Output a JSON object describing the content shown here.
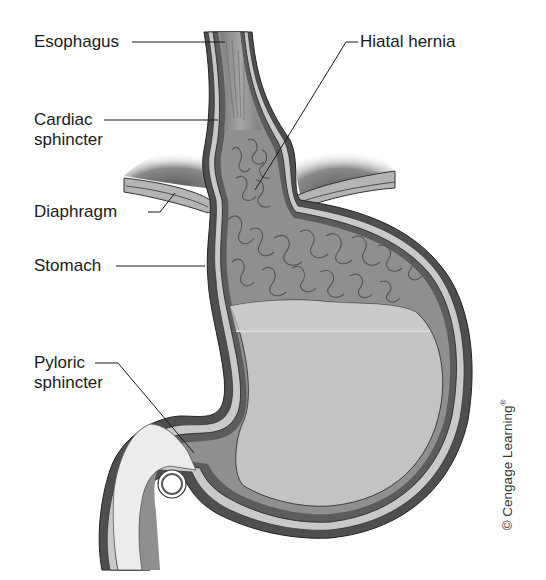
{
  "figure": {
    "type": "anatomical-diagram",
    "labels": {
      "esophagus": "Esophagus",
      "cardiac_sphincter_line1": "Cardiac",
      "cardiac_sphincter_line2": "sphincter",
      "diaphragm": "Diaphragm",
      "stomach": "Stomach",
      "pyloric_sphincter_line1": "Pyloric",
      "pyloric_sphincter_line2": "sphincter",
      "hiatal_hernia": "Hiatal hernia"
    },
    "copyright": {
      "text": "© Cengage Learning",
      "mark": "®"
    },
    "colors": {
      "background": "#ffffff",
      "wall_dark": "#5a5a5a",
      "wall_light": "#c8c8c8",
      "mucosa": "#8f8f8f",
      "rugae": "#9c9c9c",
      "fluid": "#c2c2c2",
      "fluid_surface": "#dcdcdc",
      "duodenum_lumen": "#ececec",
      "diaphragm": "#b0b0b0",
      "diaphragm_shadow": "#7a7a7a",
      "text": "#1a1a1a"
    }
  }
}
